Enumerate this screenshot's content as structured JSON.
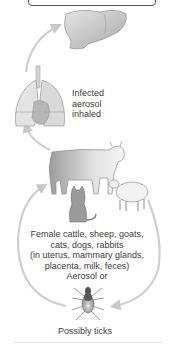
{
  "diagram": {
    "type": "transmission-cycle",
    "nodes": [
      {
        "id": "liver",
        "name": "Liver",
        "icon": "liver-icon"
      },
      {
        "id": "lungs",
        "name": "Lungs",
        "icon": "lungs-icon",
        "label": [
          "Infected",
          "aerosol",
          "inhaled"
        ]
      },
      {
        "id": "hosts",
        "name": "Animal reservoirs",
        "icons": [
          "cow-icon",
          "sheep-icon",
          "cat-icon"
        ],
        "label": [
          "Female cattle, sheep, goats,",
          "cats, dogs, rabbits",
          "(in uterus, mammary glands,",
          "placenta, milk, feces)",
          "Aerosol or"
        ]
      },
      {
        "id": "ticks",
        "name": "Ticks",
        "icon": "tick-icon",
        "label": [
          "Possibly ticks"
        ]
      }
    ],
    "edges": [
      {
        "from": "lungs",
        "to": "liver"
      },
      {
        "from": "hosts",
        "to": "lungs"
      },
      {
        "from": "ticks",
        "to": "hosts",
        "side": "left"
      },
      {
        "from": "hosts",
        "to": "ticks",
        "side": "right"
      }
    ]
  },
  "labels": {
    "aerosol": [
      "Infected",
      "aerosol",
      "inhaled"
    ],
    "hosts": [
      "Female cattle, sheep, goats,",
      "cats, dogs, rabbits",
      "(in uterus, mammary glands,",
      "placenta, milk, feces)",
      "Aerosol or"
    ],
    "ticks": "Possibly ticks"
  },
  "colors": {
    "arrow": "#c8c8c8",
    "organ_fill": "#cfcfcf",
    "text": "#3d3d3d",
    "box_border": "#555555"
  }
}
